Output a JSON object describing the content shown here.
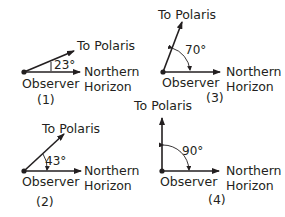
{
  "diagrams": [
    {
      "number": "(1)",
      "angle": "23°",
      "polaris_label": "To Polaris",
      "observer_label": "Observer",
      "horizon_label_line1": "Northern",
      "horizon_label_line2": "Horizon"
    },
    {
      "number": "(2)",
      "angle": "43°",
      "polaris_label": "To Polaris",
      "observer_label": "Observer",
      "horizon_label_line1": "Northern",
      "horizon_label_line2": "Horizon"
    },
    {
      "number": "(3)",
      "angle": "70°",
      "polaris_label": "To Polaris",
      "observer_label": "Observer",
      "horizon_label_line1": "Northern",
      "horizon_label_line2": "Horizon"
    },
    {
      "number": "(4)",
      "angle": "90°",
      "polaris_label": "To Polaris",
      "observer_label": "Observer",
      "horizon_label_line1": "Northern",
      "horizon_label_line2": "Horizon"
    }
  ],
  "colors": {
    "line": "#231f20",
    "background": "#ffffff"
  }
}
